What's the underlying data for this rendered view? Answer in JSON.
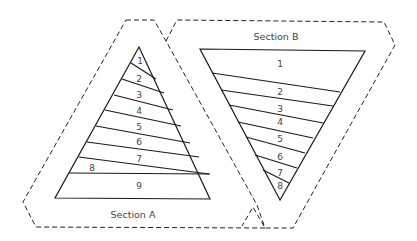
{
  "diagram": {
    "sections": [
      {
        "name": "Section A",
        "pieces": [
          "1",
          "2",
          "3",
          "4",
          "5",
          "6",
          "7",
          "8",
          "9"
        ]
      },
      {
        "name": "Section B",
        "pieces": [
          "1",
          "2",
          "3",
          "4",
          "5",
          "6",
          "7",
          "8"
        ]
      }
    ]
  }
}
